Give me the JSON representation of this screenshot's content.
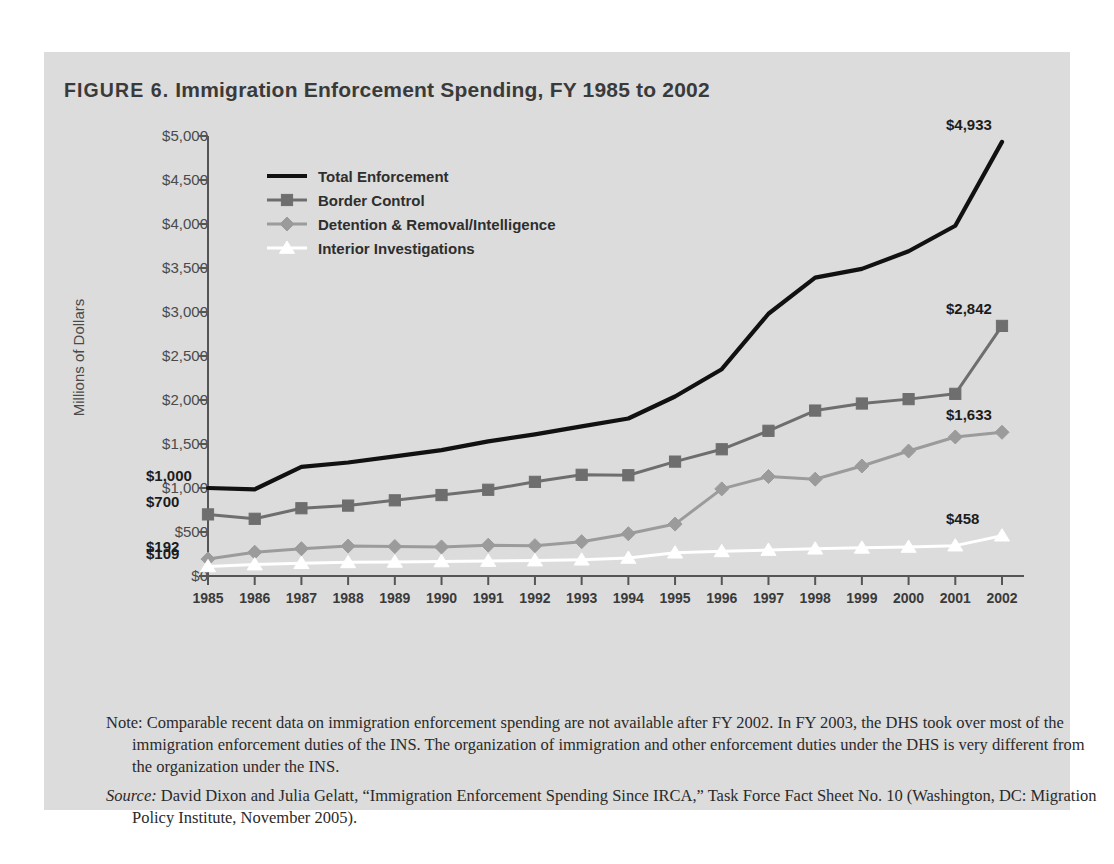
{
  "figure": {
    "number_label": "FIGURE 6.",
    "title": "Immigration Enforcement Spending, FY 1985 to 2002",
    "full_title": "FIGURE 6. Immigration Enforcement Spending, FY 1985 to 2002"
  },
  "notes": {
    "note_text": "Note: Comparable recent data on immigration enforcement spending are not available after FY 2002. In FY 2003, the DHS took over most of the immigration enforcement duties of the INS. The organization of immigration and other enforcement duties under the DHS is very different from the organization under the INS.",
    "source_label": "Source:",
    "source_text": " David Dixon and Julia Gelatt, “Immigration Enforcement Spending Since IRCA,” Task Force Fact Sheet No. 10 (Washington, DC: Migration Policy Institute, November 2005)."
  },
  "colors": {
    "panel_background": "#dcdcdc",
    "page_background": "#ffffff",
    "total_enforcement": "#111111",
    "border_control": "#6e6e6e",
    "detention_removal": "#9b9b9b",
    "interior_investigations": "#ffffff",
    "axis": "#555555",
    "text": "#3a3a3a"
  },
  "chart_data": {
    "type": "line",
    "title": "Immigration Enforcement Spending, FY 1985 to 2002",
    "xlabel": "",
    "ylabel": "Millions of Dollars",
    "ylim": [
      0,
      5000
    ],
    "ytick_values": [
      0,
      500,
      1000,
      1500,
      2000,
      2500,
      3000,
      3500,
      4000,
      4500,
      5000
    ],
    "ytick_labels": [
      "$0",
      "$500",
      "$1,000",
      "$1,500",
      "$2,000",
      "$2,500",
      "$3,000",
      "$3,500",
      "$4,000",
      "$4,500",
      "$5,000"
    ],
    "grid": false,
    "legend_position": "upper left inside",
    "categories": [
      1985,
      1986,
      1987,
      1988,
      1989,
      1990,
      1991,
      1992,
      1993,
      1994,
      1995,
      1996,
      1997,
      1998,
      1999,
      2000,
      2001,
      2002
    ],
    "xtick_labels": [
      "1985",
      "1986",
      "1987",
      "1988",
      "1989",
      "1990",
      "1991",
      "1992",
      "1993",
      "1994",
      "1995",
      "1996",
      "1997",
      "1998",
      "1999",
      "2000",
      "2001",
      "2002"
    ],
    "series": [
      {
        "name": "Total Enforcement",
        "marker": "none",
        "color": "#111111",
        "values": [
          1000,
          985,
          1240,
          1290,
          1360,
          1430,
          1530,
          1610,
          1700,
          1790,
          2040,
          2350,
          2980,
          3390,
          3490,
          3690,
          3980,
          4933
        ]
      },
      {
        "name": "Border Control",
        "marker": "square",
        "color": "#6e6e6e",
        "values": [
          700,
          650,
          770,
          800,
          860,
          920,
          980,
          1070,
          1150,
          1145,
          1300,
          1440,
          1650,
          1880,
          1960,
          2010,
          2070,
          2842
        ]
      },
      {
        "name": "Detention & Removal/Intelligence",
        "marker": "diamond",
        "color": "#9b9b9b",
        "values": [
          192,
          270,
          310,
          340,
          335,
          330,
          350,
          345,
          390,
          480,
          590,
          990,
          1130,
          1100,
          1250,
          1420,
          1580,
          1633
        ]
      },
      {
        "name": "Interior Investigations",
        "marker": "triangle",
        "color": "#ffffff",
        "values": [
          109,
          130,
          145,
          155,
          160,
          165,
          170,
          175,
          185,
          205,
          265,
          280,
          295,
          310,
          320,
          330,
          345,
          458
        ]
      }
    ],
    "point_labels": [
      {
        "series": "Total Enforcement",
        "year": 1985,
        "text": "$1,000",
        "side": "left"
      },
      {
        "series": "Border Control",
        "year": 1985,
        "text": "$700",
        "side": "left"
      },
      {
        "series": "Detention & Removal/Intelligence",
        "year": 1985,
        "text": "$192",
        "side": "left"
      },
      {
        "series": "Interior Investigations",
        "year": 1985,
        "text": "$109",
        "side": "left"
      },
      {
        "series": "Total Enforcement",
        "year": 2002,
        "text": "$4,933",
        "side": "right"
      },
      {
        "series": "Border Control",
        "year": 2002,
        "text": "$2,842",
        "side": "right"
      },
      {
        "series": "Detention & Removal/Intelligence",
        "year": 2002,
        "text": "$1,633",
        "side": "right"
      },
      {
        "series": "Interior Investigations",
        "year": 2002,
        "text": "$458",
        "side": "right"
      }
    ]
  }
}
